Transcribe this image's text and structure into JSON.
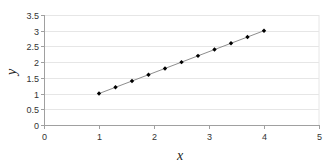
{
  "chart_data": {
    "type": "scatter",
    "title": "",
    "xlabel": "x",
    "ylabel": "y",
    "xlim": [
      0,
      5
    ],
    "ylim": [
      0,
      3.5
    ],
    "x_ticks": [
      0,
      1,
      2,
      3,
      4,
      5
    ],
    "y_ticks": [
      0,
      0.5,
      1,
      1.5,
      2,
      2.5,
      3,
      3.5
    ],
    "x_tick_labels": [
      "0",
      "1",
      "2",
      "3",
      "4",
      "5"
    ],
    "y_tick_labels": [
      "0",
      "0.5",
      "1",
      "1.5",
      "2",
      "2.5",
      "3",
      "3.5"
    ],
    "grid": {
      "horizontal": true,
      "vertical": false
    },
    "legend": null,
    "series": [
      {
        "name": "y",
        "marker": "diamond",
        "line": true,
        "color": "#000000",
        "line_color": "#808080",
        "x": [
          1.0,
          1.3,
          1.6,
          1.9,
          2.2,
          2.5,
          2.8,
          3.1,
          3.4,
          3.7,
          4.0
        ],
        "y": [
          1.0,
          1.2,
          1.4,
          1.6,
          1.8,
          2.0,
          2.2,
          2.4,
          2.6,
          2.8,
          3.0
        ]
      }
    ]
  },
  "colors": {
    "gridline": "#e6e6e6",
    "axis": "#a0a0a0",
    "marker": "#000000",
    "line": "#808080"
  }
}
